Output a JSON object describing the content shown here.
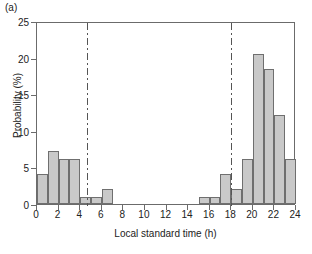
{
  "panel": {
    "label": "(a)"
  },
  "chart_data": {
    "type": "bar",
    "title": "",
    "subtitle": "",
    "xlabel": "Local standard time (h)",
    "ylabel": "Probability (%)",
    "xlim": [
      0,
      24
    ],
    "ylim": [
      0,
      25
    ],
    "xticks": [
      0,
      2,
      4,
      6,
      8,
      10,
      12,
      14,
      16,
      18,
      20,
      22,
      24
    ],
    "yticks": [
      0,
      5,
      10,
      15,
      20,
      25
    ],
    "xtick_labels": [
      "0",
      "2",
      "4",
      "6",
      "8",
      "10",
      "12",
      "14",
      "16",
      "18",
      "20",
      "22",
      "24"
    ],
    "ytick_labels": [
      "0",
      "5",
      "10",
      "15",
      "20",
      "25"
    ],
    "grid": false,
    "legend": false,
    "bin_width": 1,
    "bar_color": "#c9c9c9",
    "bar_edge_color": "#6f6f6f",
    "categories": [
      "0-1",
      "1-2",
      "2-3",
      "3-4",
      "4-5",
      "5-6",
      "6-7",
      "7-8",
      "8-9",
      "9-10",
      "10-11",
      "11-12",
      "12-13",
      "13-14",
      "14-15",
      "15-16",
      "16-17",
      "17-18",
      "18-19",
      "19-20",
      "20-21",
      "21-22",
      "22-23",
      "23-24"
    ],
    "x": [
      0,
      1,
      2,
      3,
      4,
      5,
      6,
      7,
      8,
      9,
      10,
      11,
      12,
      13,
      14,
      15,
      16,
      17,
      18,
      19,
      20,
      21,
      22,
      23
    ],
    "values": [
      4.1,
      7.2,
      6.1,
      6.1,
      1.0,
      1.0,
      2.0,
      0,
      0,
      0,
      0,
      0,
      0,
      0,
      0,
      1.0,
      1.0,
      4.1,
      2.0,
      6.1,
      20.5,
      18.4,
      12.2,
      6.1
    ],
    "annotations": [
      {
        "name": "sunrise-line",
        "type": "vline",
        "x": 4.7,
        "style": "dash-dot",
        "color": "#555555"
      },
      {
        "name": "sunset-line",
        "type": "vline",
        "x": 18.0,
        "style": "dash-dot",
        "color": "#555555"
      }
    ]
  }
}
